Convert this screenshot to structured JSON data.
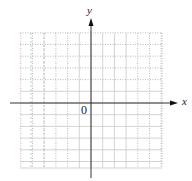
{
  "diagram": {
    "type": "coordinate-plane",
    "x_axis_label": "x",
    "y_axis_label": "y",
    "origin_label": "0",
    "grid": {
      "spacing_px": 11.7,
      "x_min_px": 20,
      "x_max_px": 162,
      "y_min_px": 33,
      "y_max_px": 168,
      "line_color": "#c8c8c8",
      "dotted_color": "#a8a8a8",
      "tint_colors": [
        "#9fc9a8",
        "#c3a8d3"
      ]
    },
    "axes": {
      "origin_px": [
        91,
        103
      ],
      "x_start_px": 10,
      "x_end_px": 178,
      "y_start_px": 178,
      "y_end_px": 18,
      "color": "#333333"
    }
  }
}
